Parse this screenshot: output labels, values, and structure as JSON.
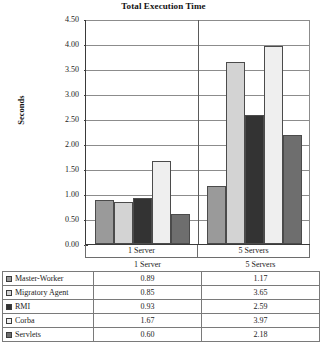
{
  "chart_data": {
    "type": "bar",
    "title": "Total Execution Time",
    "xlabel": "",
    "ylabel": "Seconds",
    "ylim": [
      0.0,
      4.5
    ],
    "ytick_step": 0.5,
    "grid": true,
    "legend_position": "bottom-table",
    "categories": [
      "1 Server",
      "5 Servers"
    ],
    "ytick_labels": [
      "4.50",
      "4.00",
      "3.50",
      "3.00",
      "2.50",
      "2.00",
      "1.50",
      "1.00",
      "0.50",
      "0.00"
    ],
    "series": [
      {
        "name": "Master-Worker",
        "values": [
          0.89,
          1.17
        ],
        "color": "#9a9a9a",
        "labels": [
          "0.89",
          "1.17"
        ]
      },
      {
        "name": "Migratory Agent",
        "values": [
          0.85,
          3.65
        ],
        "color": "#d3d3d3",
        "labels": [
          "0.85",
          "3.65"
        ]
      },
      {
        "name": "RMI",
        "values": [
          0.93,
          2.59
        ],
        "color": "#333333",
        "labels": [
          "0.93",
          "2.59"
        ]
      },
      {
        "name": "Corba",
        "values": [
          1.67,
          3.97
        ],
        "color": "#efefef",
        "labels": [
          "1.67",
          "3.97"
        ]
      },
      {
        "name": "Servlets",
        "values": [
          0.6,
          2.18
        ],
        "color": "#6e6e6e",
        "labels": [
          "0.60",
          "2.18"
        ]
      }
    ]
  },
  "table": {
    "header": {
      "series_label": "",
      "categories": [
        "1 Server",
        "5 Servers"
      ]
    }
  }
}
